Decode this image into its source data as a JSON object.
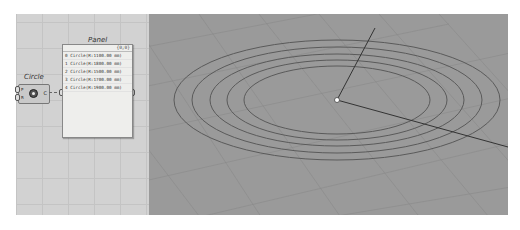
{
  "canvas": {
    "circle_component": {
      "label": "Circle",
      "inputs": [
        "P",
        "R"
      ],
      "output": "C",
      "icon": "circle-icon"
    },
    "panel": {
      "label": "Panel",
      "count": "{0;0}",
      "rows": [
        "0 Circle(R:1100.00 mm)",
        "1 Circle(R:1800.00 mm)",
        "2 Circle(R:1500.00 mm)",
        "3 Circle(R:1700.00 mm)",
        "4 Circle(R:1900.00 mm)"
      ]
    }
  },
  "viewport": {
    "circles": 5,
    "colors": {
      "background": "#9a9a9a",
      "curves": "#5a5a5a",
      "axis": "#333333"
    }
  }
}
